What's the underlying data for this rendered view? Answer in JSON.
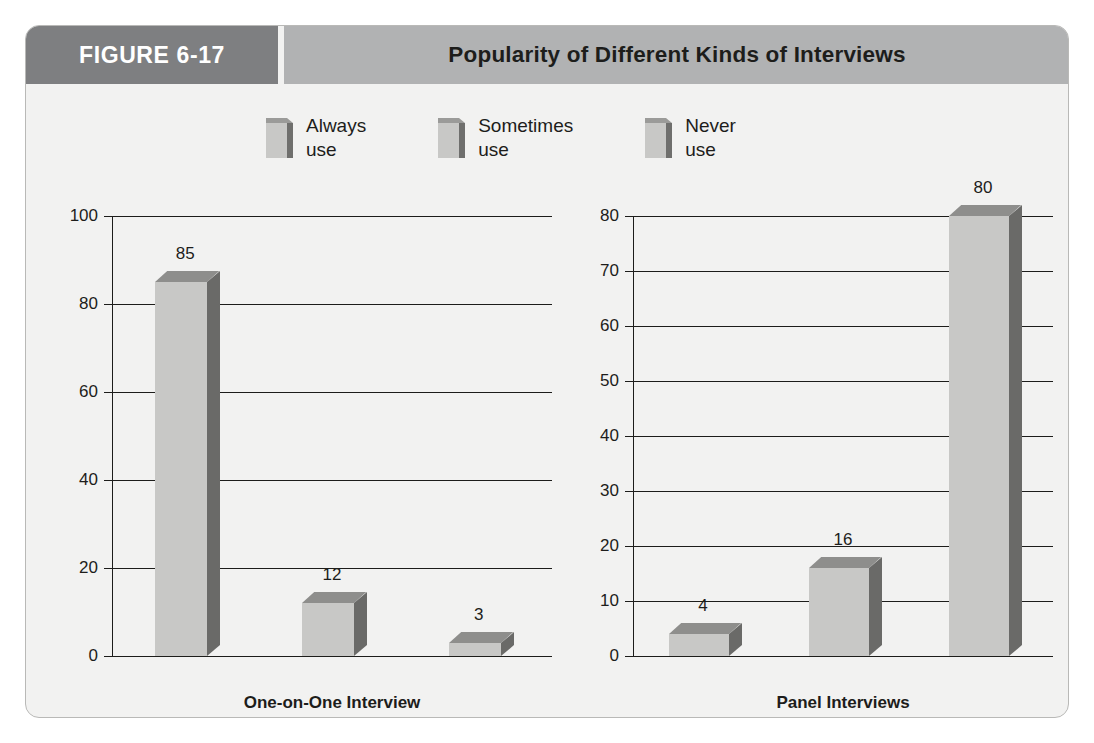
{
  "figure": {
    "tab_label": "FIGURE 6-17",
    "title": "Popularity of Different Kinds of Interviews"
  },
  "legend": {
    "items": [
      {
        "label": "Always\nuse",
        "icon": "bar-swatch-icon"
      },
      {
        "label": "Sometimes\nuse",
        "icon": "bar-swatch-icon"
      },
      {
        "label": "Never\nuse",
        "icon": "bar-swatch-icon"
      }
    ]
  },
  "colors": {
    "tab_bg": "#7e7f81",
    "header_bg": "#b1b2b3",
    "card_bg": "#f2f2f1",
    "bar_front": "#c8c8c6",
    "bar_top": "#8e8e8c",
    "bar_side": "#6a6a68",
    "axis": "#1d1d1b"
  },
  "chart_data": [
    {
      "type": "bar",
      "title": "Popularity of Different Kinds of Interviews",
      "subtitle": "One-on-One Interview",
      "xlabel": "One-on-One Interview",
      "ylabel": "",
      "categories": [
        "Always use",
        "Sometimes use",
        "Never use"
      ],
      "values": [
        85,
        12,
        3
      ],
      "value_labels": [
        "85",
        "12",
        "3"
      ],
      "ylim": [
        0,
        100
      ],
      "yticks": [
        0,
        20,
        40,
        60,
        80,
        100
      ],
      "ytick_labels": [
        "0",
        "20",
        "40",
        "60",
        "80",
        "100"
      ],
      "grid": true,
      "legend_position": "top"
    },
    {
      "type": "bar",
      "title": "Popularity of Different Kinds of Interviews",
      "subtitle": "Panel Interviews",
      "xlabel": "Panel Interviews",
      "ylabel": "",
      "categories": [
        "Always use",
        "Sometimes use",
        "Never use"
      ],
      "values": [
        4,
        16,
        80
      ],
      "value_labels": [
        "4",
        "16",
        "80"
      ],
      "ylim": [
        0,
        80
      ],
      "yticks": [
        0,
        10,
        20,
        30,
        40,
        50,
        60,
        70,
        80
      ],
      "ytick_labels": [
        "0",
        "10",
        "20",
        "30",
        "40",
        "50",
        "60",
        "70",
        "80"
      ],
      "grid": true,
      "legend_position": "top"
    }
  ]
}
